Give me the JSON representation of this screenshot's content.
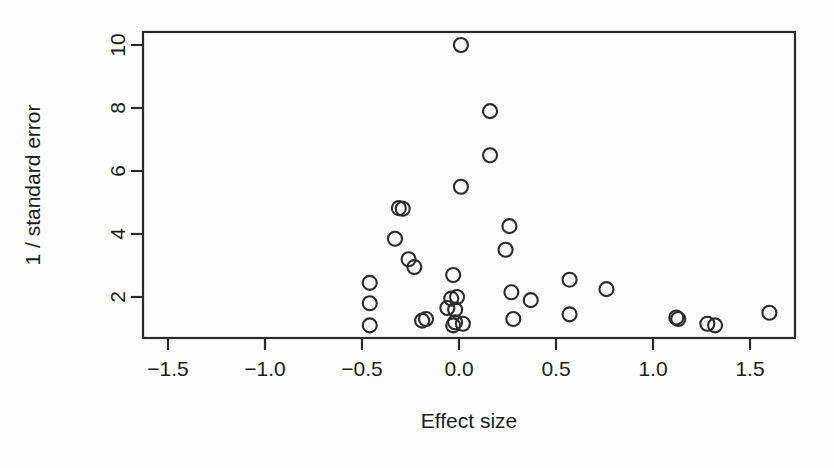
{
  "chart_data": {
    "type": "scatter",
    "title": "",
    "xlabel": "Effect size",
    "ylabel": "1 / standard error",
    "xlim": [
      -1.72,
      1.75
    ],
    "ylim": [
      0.85,
      10.35
    ],
    "xticks": [
      -1.5,
      -1.0,
      -0.5,
      0.0,
      0.5,
      1.0,
      1.5
    ],
    "xticklabels": [
      "−1.5",
      "−1.0",
      "−0.5",
      "0.0",
      "0.5",
      "1.0",
      "1.5"
    ],
    "yticks": [
      2,
      4,
      6,
      8,
      10
    ],
    "yticklabels": [
      "2",
      "4",
      "6",
      "8",
      "10"
    ],
    "grid": false,
    "legend": null,
    "marker": "open-circle",
    "marker_radius_px": 7,
    "point_count": 35,
    "points": [
      {
        "x": 0.01,
        "y": 10.0
      },
      {
        "x": 0.16,
        "y": 7.9
      },
      {
        "x": 0.16,
        "y": 6.5
      },
      {
        "x": 0.01,
        "y": 5.5
      },
      {
        "x": -0.29,
        "y": 4.8
      },
      {
        "x": 0.26,
        "y": 4.25
      },
      {
        "x": -0.33,
        "y": 3.85
      },
      {
        "x": 0.24,
        "y": 3.5
      },
      {
        "x": -0.26,
        "y": 3.2
      },
      {
        "x": -0.23,
        "y": 2.95
      },
      {
        "x": -0.03,
        "y": 2.7
      },
      {
        "x": 0.57,
        "y": 2.55
      },
      {
        "x": -0.46,
        "y": 2.45
      },
      {
        "x": 0.76,
        "y": 2.25
      },
      {
        "x": 0.27,
        "y": 2.15
      },
      {
        "x": -0.01,
        "y": 2.0
      },
      {
        "x": -0.04,
        "y": 1.95
      },
      {
        "x": 0.37,
        "y": 1.9
      },
      {
        "x": -0.46,
        "y": 1.8
      },
      {
        "x": -0.06,
        "y": 1.65
      },
      {
        "x": -0.02,
        "y": 1.6
      },
      {
        "x": 1.12,
        "y": 1.35
      },
      {
        "x": 1.13,
        "y": 1.3
      },
      {
        "x": 1.6,
        "y": 1.5
      },
      {
        "x": 0.57,
        "y": 1.45
      },
      {
        "x": 0.28,
        "y": 1.3
      },
      {
        "x": -0.17,
        "y": 1.3
      },
      {
        "x": -0.46,
        "y": 1.1
      },
      {
        "x": -0.02,
        "y": 1.2
      },
      {
        "x": -0.03,
        "y": 1.1
      },
      {
        "x": 1.28,
        "y": 1.15
      },
      {
        "x": 1.32,
        "y": 1.1
      },
      {
        "x": -0.19,
        "y": 1.25
      },
      {
        "x": 0.02,
        "y": 1.15
      },
      {
        "x": -0.31,
        "y": 4.82
      }
    ],
    "colors": {
      "marker_stroke": "#2b2b2b",
      "axis": "#2a2a2a",
      "text": "#1c1c1c",
      "background": "#fdfdfc"
    }
  },
  "figure": {
    "caption": "",
    "xlabel": "Effect size",
    "ylabel": "1 / standard error"
  }
}
